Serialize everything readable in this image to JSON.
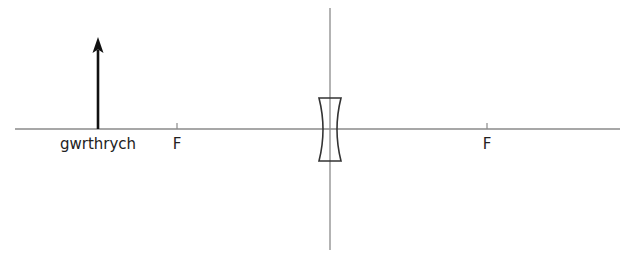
{
  "diagram": {
    "type": "optics-ray-diagram",
    "colors": {
      "axis": "#8a8a8a",
      "object_arrow": "#111111",
      "lens_outline": "#333333",
      "text": "#222222"
    },
    "object": {
      "label": "gwrthrych",
      "x": 98,
      "base_y": 129,
      "tip_y": 38
    },
    "principal_axis": {
      "x1": 15,
      "x2": 620,
      "y": 129
    },
    "lens_plane": {
      "x": 330,
      "y1": 8,
      "y2": 250
    },
    "lens": {
      "kind": "diverging",
      "cx": 330,
      "top_y": 98,
      "bottom_y": 161,
      "half_width": 11,
      "waist_half_width": 4
    },
    "focal_points": [
      {
        "label": "F",
        "x": 177
      },
      {
        "label": "F",
        "x": 487
      }
    ]
  }
}
